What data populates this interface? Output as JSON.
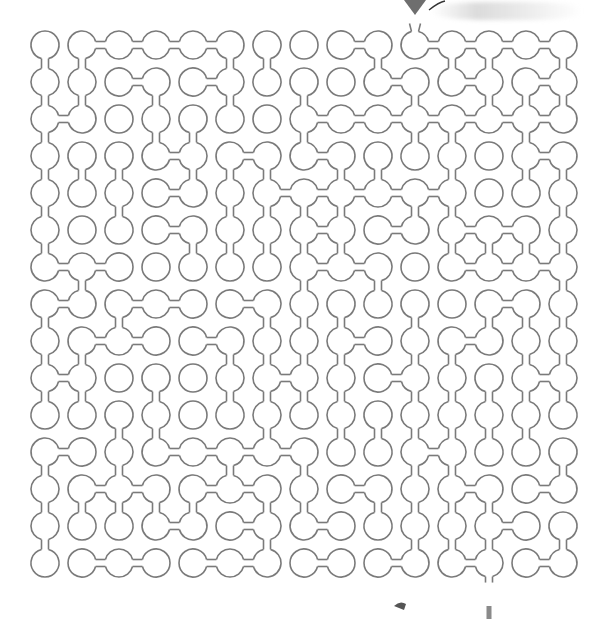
{
  "puzzle": {
    "type": "maze",
    "style": "bubble-chain",
    "cols": 15,
    "rows": 15,
    "origin": {
      "x": 45,
      "y": 45
    },
    "spacing": 37,
    "radius": 14,
    "neck_width": 7,
    "stroke_color": "#7a7a7a",
    "stroke_width": 1.6,
    "entry": {
      "col": 10,
      "row": 0,
      "side": "top",
      "marker": "triangle-arrow",
      "marker_color": "#6e6e6e"
    },
    "exit": {
      "col": 12,
      "row": 14,
      "side": "bottom",
      "marker": "bar",
      "marker_color": "#8a8a8a"
    },
    "right_links": [
      "011110001011110",
      "001010000101010",
      "100000011111111",
      "000101010000011",
      "000100111110000",
      "000100010101101",
      "110000011001110",
      "101101000000101",
      "011010001001001",
      "100000100100010",
      "000000000000000",
      "100111100010000",
      "011011001001010",
      "000101010000101",
      "011011010101011"
    ],
    "down_links": [
      "110001100101101",
      "110101010010111",
      "100110010011010",
      "111011101101011",
      "101001111011001",
      "100011111001111",
      "010000010100001",
      "101000111010111",
      "110001111011011",
      "110101111011111",
      "001100101111110",
      "101001010011001",
      "111110110111100",
      "100000100011101",
      "000000000000000"
    ]
  }
}
